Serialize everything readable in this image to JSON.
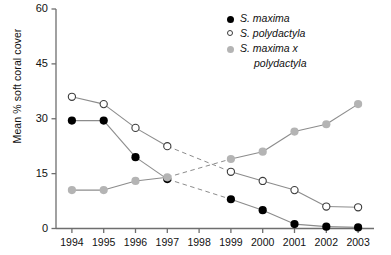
{
  "chart_data": {
    "type": "line",
    "title": "",
    "subtitle": "",
    "xlabel": "",
    "ylabel": "Mean % soft coral cover",
    "x": [
      "1994",
      "1995",
      "1996",
      "1997",
      "1998",
      "1999",
      "2000",
      "2001",
      "2002",
      "2003"
    ],
    "xlim": [
      1993.5,
      2003.5
    ],
    "ylim": [
      0,
      60
    ],
    "yticks": [
      0,
      15,
      30,
      45,
      60
    ],
    "ytick_labels": [
      "0",
      "15",
      "30",
      "45",
      "60"
    ],
    "grid": false,
    "legend_position": "top-right",
    "missing_year": "1998",
    "series": [
      {
        "name": "S. maxima",
        "marker": "filled-circle",
        "color": "#000000",
        "values": [
          29.5,
          29.5,
          19.5,
          13.5,
          null,
          8.0,
          5.0,
          1.2,
          0.5,
          0.3
        ]
      },
      {
        "name": "S. polydactyla",
        "marker": "open-circle",
        "color": "#ffffff",
        "edge_color": "#3c3c3c",
        "values": [
          36.0,
          34.0,
          27.5,
          22.5,
          null,
          15.5,
          13.0,
          10.5,
          6.0,
          5.8
        ]
      },
      {
        "name": "S. maxima x polydactyla",
        "marker": "gray-circle",
        "color": "#b4b4b4",
        "values": [
          10.5,
          10.5,
          13.0,
          14.0,
          null,
          19.0,
          21.0,
          26.5,
          28.5,
          34.0
        ]
      }
    ]
  },
  "legend": {
    "entries": [
      {
        "label": "S. maxima",
        "marker": "filled-circle"
      },
      {
        "label": "S. polydactyla",
        "marker": "open-circle"
      },
      {
        "label": "S. maxima x",
        "label_cont": "polydactyla",
        "marker": "gray-circle"
      }
    ]
  },
  "colors": {
    "series_maxima": "#000000",
    "series_polydactyla": "#ffffff",
    "series_hybrid": "#b4b4b4",
    "axis": "#6e6e6e",
    "line": "#8c8c8c",
    "text": "#111111"
  }
}
